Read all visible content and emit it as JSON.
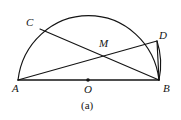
{
  "figure": {
    "caption": "(a)",
    "type": "geometry-diagram",
    "width": 181,
    "height": 120,
    "background_color": "#ffffff",
    "stroke_color": "#141414",
    "labels": {
      "A": "A",
      "B": "B",
      "C": "C",
      "D": "D",
      "M": "M",
      "O": "O"
    },
    "points": {
      "A": {
        "x": 18,
        "y": 80
      },
      "B": {
        "x": 159,
        "y": 80
      },
      "O": {
        "x": 88,
        "y": 80
      },
      "C": {
        "x": 40,
        "y": 29
      },
      "D": {
        "x": 157,
        "y": 41
      },
      "M": {
        "x": 98,
        "y": 53
      }
    },
    "arc": {
      "center_x": 88,
      "center_y": 80,
      "radius_x": 71,
      "radius_y": 73,
      "start_angle_deg": 180,
      "end_angle_deg": 0
    },
    "segments": [
      {
        "name": "diameter-AB",
        "from": "A",
        "to": "B"
      },
      {
        "name": "chord-CB",
        "from": "C",
        "to": "B"
      },
      {
        "name": "chord-AD",
        "from": "A",
        "to": "D"
      },
      {
        "name": "chord-DB",
        "from": "D",
        "to": "B"
      }
    ],
    "marks": [
      {
        "name": "center-dot-O",
        "x": 88,
        "y": 80,
        "radius": 1.8
      }
    ]
  }
}
